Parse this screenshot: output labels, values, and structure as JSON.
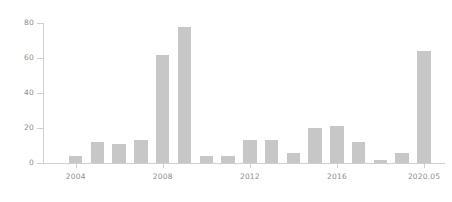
{
  "chart_data": {
    "type": "bar",
    "title": "",
    "subtitle": "",
    "xlabel": "",
    "ylabel": "",
    "categories": [
      "2003",
      "2004",
      "2005",
      "2006",
      "2007",
      "2008",
      "2009",
      "2010",
      "2011",
      "2012",
      "2013",
      "2014",
      "2015",
      "2016",
      "2017",
      "2018",
      "2019",
      "2020.05"
    ],
    "values": [
      0,
      4,
      12,
      11,
      13,
      62,
      78,
      4,
      4,
      13,
      13,
      6,
      20,
      21,
      12,
      1.5,
      5.5,
      64
    ],
    "series": [
      {
        "name": "count",
        "values": [
          0,
          4,
          12,
          11,
          13,
          62,
          78,
          4,
          4,
          13,
          13,
          6,
          20,
          21,
          12,
          1.5,
          5.5,
          64
        ]
      }
    ],
    "ylim": [
      0,
      80
    ],
    "yticks": [
      0,
      20,
      40,
      60,
      80
    ],
    "ytick_labels": [
      "0",
      "20",
      "40",
      "60",
      "80"
    ],
    "xtick_labels": [
      "2004",
      "2008",
      "2012",
      "2016",
      "2020.05"
    ],
    "xtick_categories": [
      "2004",
      "2008",
      "2012",
      "2016",
      "2020.05"
    ],
    "grid": false,
    "legend": "none",
    "bar_color": "#c7c7c7",
    "axis_color": "#cfcfcf",
    "tick_label_color": "#8d8d8d",
    "background_color": "#ffffff"
  }
}
